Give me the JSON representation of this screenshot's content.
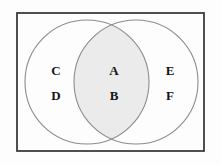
{
  "figure": {
    "name": "two-set-venn-diagram",
    "type": "venn",
    "universe_shape": "rectangle",
    "background_color": "#fdfdfd",
    "border_color": "#3c3c3c",
    "circle_stroke_color": "#8c8c8c",
    "intersection_fill_color": "#ebebeb",
    "label_color": "#151515",
    "rect": {
      "x": 16,
      "y": 12,
      "width": 189,
      "height": 140
    },
    "left_circle": {
      "cx": 87,
      "cy": 82,
      "r": 62
    },
    "right_circle": {
      "cx": 136,
      "cy": 82,
      "r": 62
    }
  },
  "regions": {
    "left_only": {
      "name": "left-circle-only",
      "labels": [
        {
          "text": "C",
          "x": 56,
          "y": 70
        },
        {
          "text": "D",
          "x": 56,
          "y": 95
        }
      ]
    },
    "intersection": {
      "name": "intersection",
      "labels": [
        {
          "text": "A",
          "x": 114,
          "y": 70
        },
        {
          "text": "B",
          "x": 114,
          "y": 95
        }
      ]
    },
    "right_only": {
      "name": "right-circle-only",
      "labels": [
        {
          "text": "E",
          "x": 170,
          "y": 70
        },
        {
          "text": "F",
          "x": 170,
          "y": 95
        }
      ]
    }
  },
  "labels": {
    "c": "C",
    "d": "D",
    "a": "A",
    "b": "B",
    "e": "E",
    "f": "F"
  }
}
